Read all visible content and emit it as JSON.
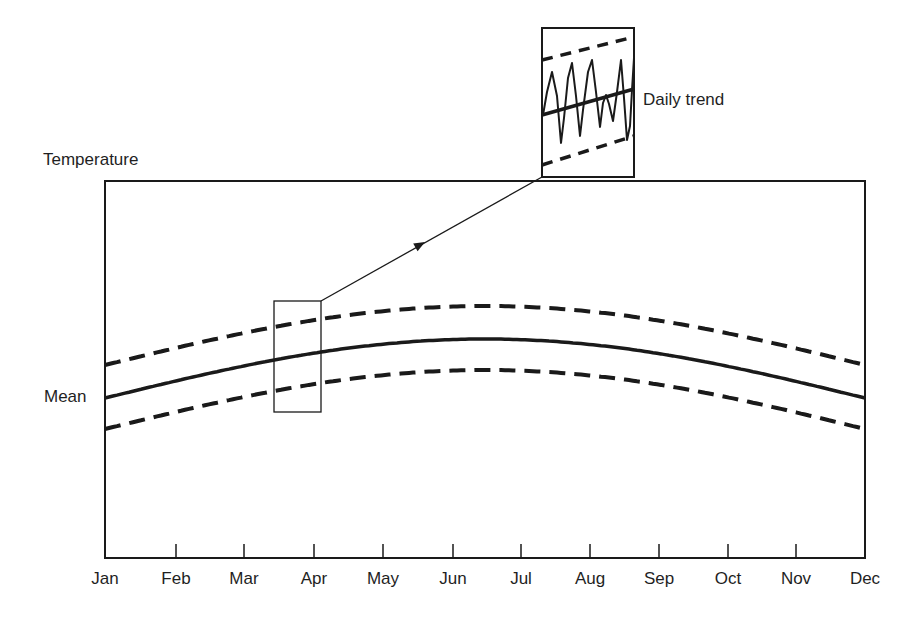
{
  "chart_data": {
    "type": "line",
    "title": "",
    "ylabel": "Temperature",
    "xlabel": "",
    "y_axis_numeric": false,
    "y_ticks": [],
    "categories": [
      "Jan",
      "Feb",
      "Mar",
      "Apr",
      "May",
      "Jun",
      "Jul",
      "Aug",
      "Sep",
      "Oct",
      "Nov",
      "Dec"
    ],
    "annotations": {
      "mean_label": "Mean",
      "inset_label": "Daily trend"
    },
    "legend": null,
    "grid": false,
    "note": "Schematic figure with no numeric temperature scale. All coordinates below are pixel positions measured off the image, NOT temperature values.",
    "geometry_px": {
      "plot_frame": {
        "left": 105,
        "right": 865,
        "top": 181,
        "bottom": 558
      },
      "tick_x": [
        105,
        176,
        244,
        314,
        383,
        453,
        521,
        590,
        659,
        728,
        796,
        865
      ],
      "curve_model": {
        "description": "Sinusoid fitted to measured points; estimated, not printed on chart",
        "formula": "y = base - amplitude * sin(pi * (x - left) / (right - left))",
        "base_y": 398,
        "amplitude": 59,
        "upper_band_offset": -33,
        "lower_band_offset": 31
      },
      "measured_points": [
        {
          "x": 105,
          "mean": 398,
          "upper": 367,
          "lower": 429,
          "where": "left edge (Jan)"
        },
        {
          "x": 274,
          "mean": 364,
          "upper": 334,
          "lower": 396,
          "where": "highlight box left edge"
        },
        {
          "x": 485,
          "mean": 339,
          "upper": 304,
          "lower": 370,
          "where": "peak (~Jun-Jul)"
        },
        {
          "x": 865,
          "mean": 398,
          "upper": 365,
          "lower": 430,
          "where": "right edge (Dec)"
        }
      ]
    },
    "series": [
      {
        "name": "Mean",
        "style": "solid",
        "shape": "sinusoid, min at Jan/Dec, max mid-year"
      },
      {
        "name": "Upper bound",
        "style": "dashed",
        "shape": "parallel to mean, above"
      },
      {
        "name": "Lower bound",
        "style": "dashed",
        "shape": "parallel to mean, below"
      }
    ],
    "highlight_region": {
      "description": "Small rectangle around late Mar to Apr, magnified in inset",
      "rect_px": {
        "x": 274,
        "y": 301,
        "w": 47,
        "h": 111
      }
    },
    "inset": {
      "rect_px": {
        "x": 542,
        "y": 28,
        "w": 92,
        "h": 149
      },
      "content": "Magnified view: dashed bounds, rising mean line, and jagged daily oscillation",
      "upper_dashed_px": [
        [
          542,
          60
        ],
        [
          634,
          37
        ]
      ],
      "mean_px": [
        [
          542,
          115
        ],
        [
          634,
          89
        ]
      ],
      "lower_dashed_px": [
        [
          542,
          165
        ],
        [
          634,
          136
        ]
      ]
    },
    "arrow": {
      "from_px": [
        321,
        301
      ],
      "to_px": [
        542,
        177
      ],
      "arrowhead_px": [
        425,
        242
      ]
    }
  },
  "labels": {
    "y_axis": "Temperature",
    "mean": "Mean",
    "inset": "Daily trend"
  },
  "colors": {
    "ink": "#1a1a1a",
    "background": "#ffffff"
  }
}
